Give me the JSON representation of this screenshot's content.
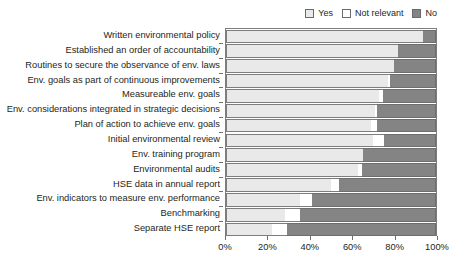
{
  "chart_data": {
    "type": "bar",
    "subtype": "horizontal-stacked-100",
    "title": "",
    "xlabel": "",
    "ylabel": "",
    "xlim": [
      0,
      100
    ],
    "grid": false,
    "legend_position": "top-right",
    "xticks": [
      "0%",
      "20%",
      "40%",
      "60%",
      "80%",
      "100%"
    ],
    "xtick_values": [
      0,
      20,
      40,
      60,
      80,
      100
    ],
    "categories": [
      "Written environmental policy",
      "Established an order of accountability",
      "Routines to secure the observance of env. laws",
      "Env. goals as part of continuous improvements",
      "Measureable env. goals",
      "Env. considerations integrated in strategic decisions",
      "Plan of action to achieve env. goals",
      "Initial environmental review",
      "Env. training program",
      "Environmental audits",
      "HSE data in annual report",
      "Env. indicators to measure env. performance",
      "Benchmarking",
      "Separate HSE report"
    ],
    "series": [
      {
        "name": "Yes",
        "color": "#e9e9e9",
        "values": [
          94,
          82,
          80,
          77,
          73,
          71,
          69,
          70,
          65,
          63,
          50,
          35,
          28,
          22
        ]
      },
      {
        "name": "Not relevant",
        "color": "#ffffff",
        "values": [
          0,
          0,
          0,
          1,
          2,
          1,
          3,
          5,
          0,
          2,
          4,
          6,
          7,
          7
        ]
      },
      {
        "name": "No",
        "color": "#848484",
        "values": [
          6,
          18,
          20,
          22,
          25,
          28,
          28,
          25,
          35,
          35,
          46,
          59,
          65,
          71
        ]
      }
    ]
  },
  "legend": {
    "entries": [
      {
        "label": "Yes",
        "color": "#e9e9e9"
      },
      {
        "label": "Not relevant",
        "color": "#ffffff"
      },
      {
        "label": "No",
        "color": "#848484"
      }
    ]
  },
  "colors": {
    "yes": "#e9e9e9",
    "not_relevant": "#ffffff",
    "no": "#848484",
    "axis": "#6e6e6e",
    "text": "#231f20",
    "background": "#ffffff"
  }
}
